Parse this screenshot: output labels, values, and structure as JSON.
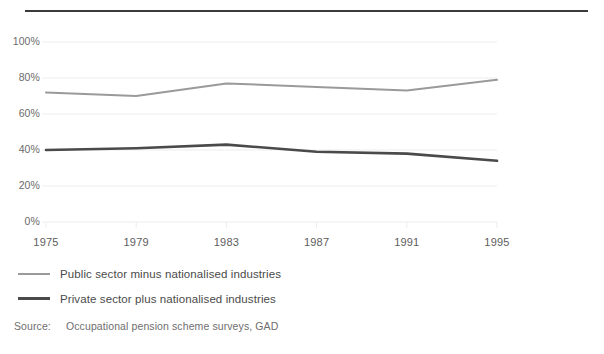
{
  "chart_data": {
    "type": "line",
    "title": "",
    "subtitle": "",
    "xlabel": "",
    "ylabel": "",
    "x": [
      1975,
      1979,
      1983,
      1987,
      1991,
      1995
    ],
    "xtick_labels": [
      "1975",
      "1979",
      "1983",
      "1987",
      "1991",
      "1995"
    ],
    "ytick_labels": [
      "100%",
      "80%",
      "60%",
      "40%",
      "20%",
      "0%"
    ],
    "ytick_values": [
      100,
      80,
      60,
      40,
      20,
      0
    ],
    "ylim": [
      0,
      100
    ],
    "xlim": [
      1975,
      1995
    ],
    "grid": "horizontal",
    "legend_position": "below-left",
    "series": [
      {
        "name": "Public sector minus nationalised industries",
        "color": "#9a9a9a",
        "width": 2,
        "values": [
          72,
          70,
          77,
          75,
          73,
          79
        ]
      },
      {
        "name": "Private sector plus nationalised industries",
        "color": "#4a4a4a",
        "width": 2.6,
        "values": [
          40,
          41,
          43,
          39,
          38,
          34
        ]
      }
    ]
  },
  "legend": {
    "items": [
      {
        "label": "Public sector minus nationalised industries",
        "swatch": "light-line-swatch"
      },
      {
        "label": "Private sector plus nationalised industries",
        "swatch": "dark-line-swatch"
      }
    ]
  },
  "source": {
    "key": "Source:",
    "value": "Occupational pension scheme surveys, GAD"
  },
  "colors": {
    "rule": "#3b3b3b",
    "grid": "#ededed",
    "axis_text": "#6b6b6b",
    "series_light": "#9a9a9a",
    "series_dark": "#4a4a4a",
    "background": "#ffffff"
  }
}
